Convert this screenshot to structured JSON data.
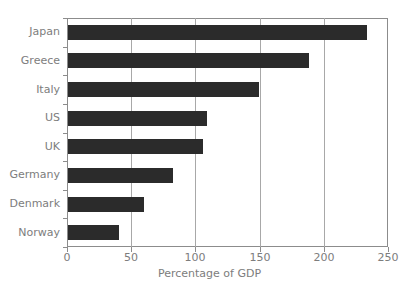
{
  "chart_data": {
    "type": "bar",
    "orientation": "horizontal",
    "title": "",
    "xlabel": "Percentage of GDP",
    "ylabel": "",
    "categories": [
      "Japan",
      "Greece",
      "Italy",
      "US",
      "UK",
      "Germany",
      "Denmark",
      "Norway"
    ],
    "values": [
      233,
      188,
      149,
      108,
      105,
      82,
      59,
      40
    ],
    "xlim": [
      0,
      250
    ],
    "xticks": [
      0,
      50,
      100,
      150,
      200,
      250
    ],
    "xtick_labels": [
      "0",
      "50",
      "100",
      "150",
      "200",
      "250"
    ],
    "grid": "vertical",
    "legend": "none",
    "series": [
      {
        "name": "Percentage of GDP",
        "values": [
          233,
          188,
          149,
          108,
          105,
          82,
          59,
          40
        ]
      }
    ]
  },
  "style": {
    "bar_color": "#2b2b2b",
    "grid_color": "#a8a8a8",
    "frame_color": "#8c8c8c",
    "text_color": "#7d7d7d",
    "background": "#ffffff"
  }
}
